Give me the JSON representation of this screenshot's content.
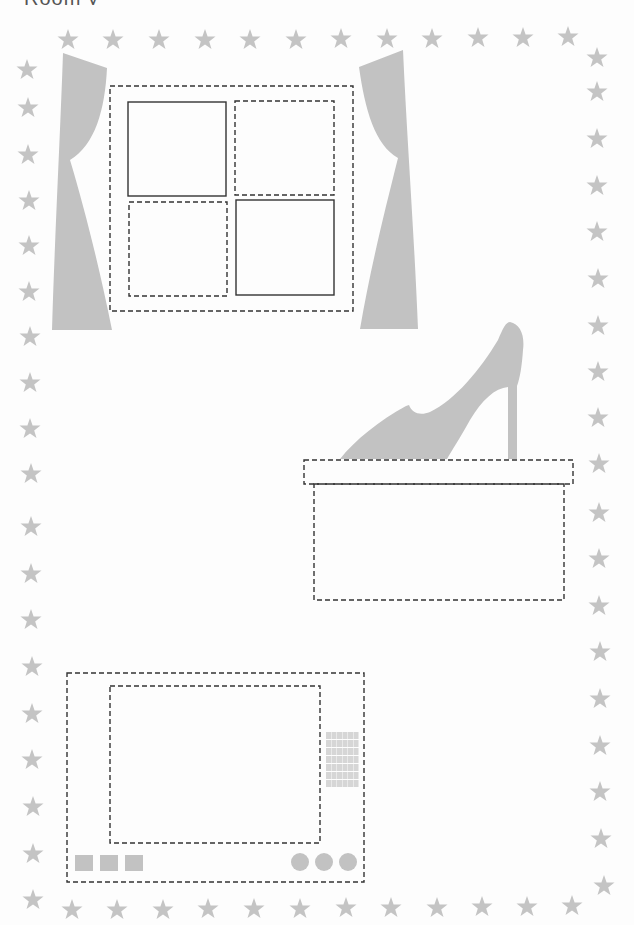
{
  "page": {
    "clipped_heading": "Room y",
    "background": "#fdfdfd"
  },
  "colors": {
    "star": "#c4c4c4",
    "fill_gray": "#c2c2c2",
    "dashed_line": "#333333",
    "solid_line": "#333333",
    "grille": "#d6d6d6"
  },
  "border": {
    "top_stars": [
      [
        68,
        40
      ],
      [
        113,
        40
      ],
      [
        159,
        40
      ],
      [
        205,
        40
      ],
      [
        250,
        40
      ],
      [
        296,
        40
      ],
      [
        341,
        39
      ],
      [
        387,
        39
      ],
      [
        432,
        39
      ],
      [
        478,
        38
      ],
      [
        523,
        38
      ],
      [
        568,
        37
      ],
      [
        597,
        58
      ]
    ],
    "left_stars": [
      [
        27,
        70
      ],
      [
        28,
        108
      ],
      [
        28,
        155
      ],
      [
        29,
        201
      ],
      [
        29,
        246
      ],
      [
        29,
        292
      ],
      [
        30,
        337
      ],
      [
        30,
        383
      ],
      [
        30,
        429
      ],
      [
        31,
        474
      ],
      [
        31,
        527
      ],
      [
        31,
        574
      ],
      [
        31,
        620
      ],
      [
        32,
        667
      ],
      [
        32,
        714
      ],
      [
        32,
        760
      ],
      [
        33,
        807
      ],
      [
        33,
        854
      ]
    ],
    "right_stars": [
      [
        597,
        92
      ],
      [
        597,
        139
      ],
      [
        597,
        186
      ],
      [
        597,
        232
      ],
      [
        598,
        279
      ],
      [
        598,
        326
      ],
      [
        598,
        372
      ],
      [
        598,
        418
      ],
      [
        599,
        464
      ],
      [
        599,
        513
      ],
      [
        599,
        559
      ],
      [
        599,
        606
      ],
      [
        600,
        652
      ],
      [
        600,
        699
      ],
      [
        600,
        746
      ],
      [
        600,
        792
      ],
      [
        601,
        839
      ]
    ],
    "bottom_stars": [
      [
        33,
        900
      ],
      [
        72,
        910
      ],
      [
        117,
        910
      ],
      [
        163,
        910
      ],
      [
        208,
        909
      ],
      [
        254,
        909
      ],
      [
        300,
        909
      ],
      [
        346,
        908
      ],
      [
        391,
        908
      ],
      [
        437,
        908
      ],
      [
        482,
        907
      ],
      [
        527,
        907
      ],
      [
        572,
        906
      ],
      [
        604,
        886
      ]
    ]
  },
  "window": {
    "frame": {
      "x": 110,
      "y": 86,
      "w": 243,
      "h": 225
    },
    "panes": [
      {
        "name": "top-left",
        "x": 128,
        "y": 102,
        "w": 98,
        "h": 94,
        "style": "solid"
      },
      {
        "name": "top-right",
        "x": 235,
        "y": 101,
        "w": 99,
        "h": 94,
        "style": "dashed"
      },
      {
        "name": "bottom-left",
        "x": 129,
        "y": 202,
        "w": 98,
        "h": 94,
        "style": "dashed"
      },
      {
        "name": "bottom-right",
        "x": 236,
        "y": 200,
        "w": 98,
        "h": 95,
        "style": "solid"
      }
    ]
  },
  "shoe_box": {
    "lid": {
      "x": 304,
      "y": 460,
      "w": 269,
      "h": 24
    },
    "body": {
      "x": 314,
      "y": 484,
      "w": 250,
      "h": 116
    }
  },
  "tv": {
    "frame": {
      "x": 67,
      "y": 673,
      "w": 297,
      "h": 209
    },
    "screen": {
      "x": 110,
      "y": 686,
      "w": 210,
      "h": 157
    },
    "grille": {
      "x": 326,
      "y": 732,
      "cols": 6,
      "rows": 7,
      "cell_w": 5,
      "cell_h": 7
    },
    "square_buttons": [
      [
        75,
        855
      ],
      [
        100,
        855
      ],
      [
        125,
        855
      ]
    ],
    "round_knobs": [
      [
        300,
        862
      ],
      [
        324,
        862
      ],
      [
        348,
        862
      ]
    ]
  }
}
